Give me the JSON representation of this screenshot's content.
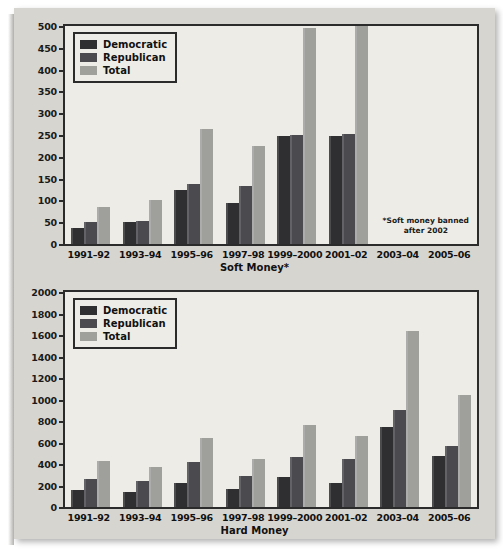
{
  "figure": {
    "background": "#ffffff",
    "paper_color": "#d7d5cf",
    "plot_background": "#eeece6"
  },
  "series_colors": {
    "democratic": "#2f2f32",
    "republican": "#4a4a4f",
    "total": "#9f9f9c"
  },
  "legend": {
    "democratic": "Democratic",
    "republican": "Republican",
    "total": "Total"
  },
  "soft": {
    "footnote_line1": "*Soft money banned",
    "footnote_line2": "after 2002"
  },
  "chart_data": [
    {
      "id": "soft-money",
      "type": "bar",
      "title": "Soft Money*",
      "xlabel": "Soft Money*",
      "ylabel": "",
      "ylim": [
        0,
        500
      ],
      "ytick_step": 50,
      "yticks": [
        0,
        50,
        100,
        150,
        200,
        250,
        300,
        350,
        400,
        450,
        500
      ],
      "grid": false,
      "legend_position": "top-left",
      "categories": [
        "1991–92",
        "1993–94",
        "1995–96",
        "1997–98",
        "1999–2000",
        "2001–02",
        "2003–04",
        "2005–06"
      ],
      "series": [
        {
          "name": "Democratic",
          "values": [
            36,
            50,
            124,
            94,
            248,
            247,
            null,
            null
          ]
        },
        {
          "name": "Republican",
          "values": [
            50,
            52,
            138,
            132,
            250,
            253,
            null,
            null
          ]
        },
        {
          "name": "Total",
          "values": [
            86,
            102,
            263,
            225,
            495,
            500,
            null,
            null
          ]
        }
      ],
      "annotations": [
        "*Soft money banned after 2002"
      ]
    },
    {
      "id": "hard-money",
      "type": "bar",
      "title": "Hard Money",
      "xlabel": "Hard Money",
      "ylabel": "",
      "ylim": [
        0,
        2000
      ],
      "ytick_step": 200,
      "yticks": [
        0,
        200,
        400,
        600,
        800,
        1000,
        1200,
        1400,
        1600,
        1800,
        2000
      ],
      "grid": false,
      "legend_position": "top-left",
      "categories": [
        "1991–92",
        "1993–94",
        "1995–96",
        "1997–98",
        "1999–2000",
        "2001–02",
        "2003–04",
        "2005–06"
      ],
      "series": [
        {
          "name": "Democratic",
          "values": [
            160,
            140,
            225,
            165,
            275,
            220,
            740,
            470
          ]
        },
        {
          "name": "Republican",
          "values": [
            260,
            240,
            415,
            290,
            465,
            445,
            900,
            570
          ]
        },
        {
          "name": "Total",
          "values": [
            425,
            375,
            640,
            445,
            760,
            660,
            1635,
            1045
          ]
        }
      ],
      "annotations": []
    }
  ]
}
